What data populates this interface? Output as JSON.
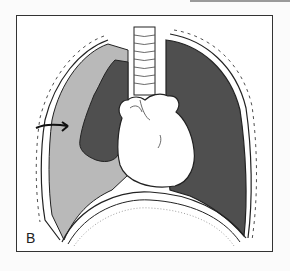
{
  "figure": {
    "panel_label": "B",
    "colors": {
      "fluid": "#b9b9b9",
      "lung": "#4f4f4f",
      "heart": "#ffffff",
      "outline": "#222222",
      "frame": "#333333"
    },
    "parts": [
      "trachea",
      "heart",
      "left-collapsed-lung",
      "pleural-fluid",
      "right-lung",
      "diaphragm",
      "chest-wall",
      "arrow"
    ]
  }
}
